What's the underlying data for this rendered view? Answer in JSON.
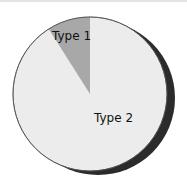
{
  "chart_data": {
    "type": "pie",
    "title": "",
    "categories": [
      "Type 1",
      "Type 2"
    ],
    "values": [
      9,
      91
    ],
    "colors": [
      "#a8a8a8",
      "#ececec"
    ],
    "shadow_color": "#2b2b2b",
    "start_angle_deg": 0,
    "direction": "counterclockwise-from-top",
    "legend": "none",
    "labels_inside": true
  },
  "labels": {
    "type1": "Type 1",
    "type2": "Type 2"
  }
}
